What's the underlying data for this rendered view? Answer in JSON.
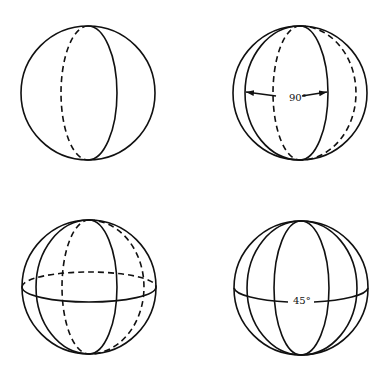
{
  "figure": {
    "panels": [
      {
        "id": "top-left",
        "description": "Sphere with one great circle through poles (front solid, back dashed)"
      },
      {
        "id": "top-right",
        "description": "Sphere with two great circles through poles at 90 degrees",
        "angle_label": "90°"
      },
      {
        "id": "bottom-left",
        "description": "Sphere with two meridian great circles and equator"
      },
      {
        "id": "bottom-right",
        "description": "Sphere with four meridians at 45 degrees and equator",
        "angle_label": "45°"
      }
    ],
    "colors": {
      "line": "#111111",
      "background": "#ffffff"
    }
  }
}
